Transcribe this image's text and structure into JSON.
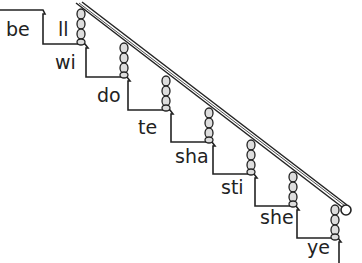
{
  "syllables": [
    {
      "text": "be",
      "x": 6,
      "y": 20
    },
    {
      "text": "ll",
      "x": 58,
      "y": 20
    },
    {
      "text": "wi",
      "x": 55,
      "y": 53
    },
    {
      "text": "do",
      "x": 97,
      "y": 86
    },
    {
      "text": "te",
      "x": 138,
      "y": 118
    },
    {
      "text": "sha",
      "x": 175,
      "y": 147
    },
    {
      "text": "sti",
      "x": 221,
      "y": 178
    },
    {
      "text": "she",
      "x": 260,
      "y": 208
    },
    {
      "text": "ye",
      "x": 307,
      "y": 238
    }
  ]
}
